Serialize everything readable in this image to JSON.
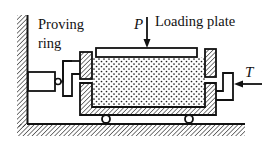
{
  "diagram": {
    "type": "direct shear apparatus schematic",
    "labels": {
      "proving_ring_line1": "Proving",
      "proving_ring_line2": "ring",
      "loading_plate": "Loading plate",
      "normal_force": "P",
      "shear_force": "T"
    },
    "components": [
      {
        "name": "fixed-wall",
        "description": "hatched fixed support on left"
      },
      {
        "name": "ground",
        "description": "hatched base"
      },
      {
        "name": "proving-ring",
        "description": "force-measuring ring connected to upper box"
      },
      {
        "name": "upper-shear-box",
        "description": "hatched upper half of shear box"
      },
      {
        "name": "lower-shear-box",
        "description": "hatched lower half of shear box, on rollers"
      },
      {
        "name": "loading-plate",
        "description": "plate on top of soil sample"
      },
      {
        "name": "soil-sample",
        "description": "dotted soil specimen"
      },
      {
        "name": "rollers",
        "count": 2
      },
      {
        "name": "shear-force-connector",
        "description": "pushes lower box, force T"
      }
    ],
    "colors": {
      "line": "#111111",
      "background": "#ffffff"
    }
  }
}
